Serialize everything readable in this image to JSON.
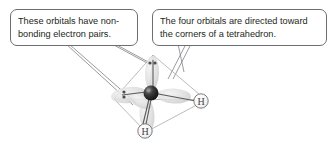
{
  "figure": {
    "kind": "molecular-orbital-diagram",
    "molecule": "water",
    "background_color": "#ffffff"
  },
  "callouts": [
    {
      "id": "left",
      "name": "callout-nonbonding-pairs",
      "line1": "These orbitals have non-",
      "line2": "bonding electron pairs.",
      "border_color": "#6d6e71",
      "text_color": "#231f20"
    },
    {
      "id": "right",
      "name": "callout-tetrahedron",
      "line1": "The four orbitals are directed toward",
      "line2": "the corners of a tetrahedron.",
      "border_color": "#6d6e71",
      "text_color": "#231f20"
    }
  ],
  "diagram": {
    "central_atom": {
      "symbol": "O",
      "label_visible": false,
      "color": "#231f20"
    },
    "hydrogens": [
      {
        "label": "H",
        "position": "right"
      },
      {
        "label": "H",
        "position": "bottom"
      }
    ],
    "lone_pairs": [
      {
        "position": "top",
        "dots": 2
      },
      {
        "position": "left",
        "dots": 2
      }
    ],
    "orbital_lobes": 4,
    "tetrahedron": {
      "edge_color": "#b3b3b3",
      "vertices": [
        "top",
        "right",
        "bottom",
        "left"
      ]
    },
    "bond_color": "#58595b",
    "lobe_color": "#d9d9d9"
  }
}
